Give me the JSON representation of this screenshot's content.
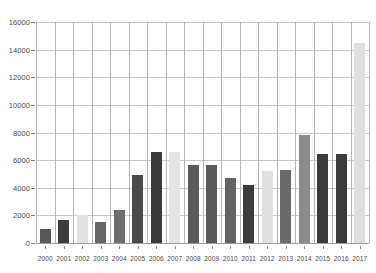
{
  "chart_data": {
    "type": "bar",
    "title": "",
    "subtitle": "",
    "xlabel": "",
    "ylabel": "",
    "categories": [
      "2000",
      "2001",
      "2002",
      "2003",
      "2004",
      "2005",
      "2006",
      "2007",
      "2008",
      "2009",
      "2010",
      "2011",
      "2012",
      "2013",
      "2014",
      "2015",
      "2016",
      "2017"
    ],
    "values": [
      1000,
      1700,
      2050,
      1550,
      2400,
      4900,
      6600,
      6600,
      5650,
      5650,
      4700,
      4200,
      5200,
      5250,
      7800,
      6450,
      6450,
      14500
    ],
    "bar_colors": [
      "#575757",
      "#3d3d3d",
      "#e2e2e2",
      "#666666",
      "#6e6e6e",
      "#4a4a4a",
      "#3a3a3a",
      "#e4e4e4",
      "#5a5a5a",
      "#5a5a5a",
      "#636363",
      "#3c3c3c",
      "#e0e0e0",
      "#6a6a6a",
      "#8b8b8b",
      "#3b3b3b",
      "#3b3b3b",
      "#dedede"
    ],
    "ylim": [
      0,
      16000
    ],
    "yticks": [
      0,
      2000,
      4000,
      6000,
      8000,
      10000,
      12000,
      14000,
      16000
    ],
    "ytick_labels": [
      "0",
      "2000",
      "4000",
      "6000",
      "8000",
      "10000",
      "12000",
      "14000",
      "16000"
    ],
    "grid": true,
    "grid_axis": "both",
    "legend": null,
    "legend_position": "none",
    "annotations": [],
    "series": [
      {
        "name": "",
        "values": [
          1000,
          1700,
          2050,
          1550,
          2400,
          4900,
          6600,
          6600,
          5650,
          5650,
          4700,
          4200,
          5200,
          5250,
          7800,
          6450,
          6450,
          14500
        ]
      }
    ]
  },
  "style": {
    "background": "#ffffff",
    "gridline_color": "#c8c8c8",
    "axis_color": "#9a9a9a",
    "tick_text_color": "#4a4a4a"
  }
}
